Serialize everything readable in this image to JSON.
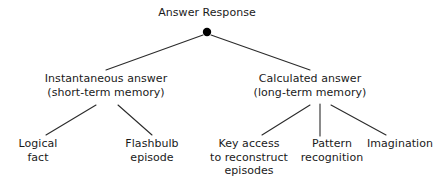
{
  "diagram": {
    "title": "Answer Response",
    "colors": {
      "background": "#ffffff",
      "text": "#1a1a1a",
      "edge": "#2b2b2b",
      "node_dot": "#000000"
    },
    "root": {
      "label": "Answer Response",
      "marker": "filled-circle-node"
    },
    "branches": [
      {
        "id": "instantaneous",
        "line1": "Instantaneous answer",
        "line2": "(short-term memory)",
        "children": [
          {
            "id": "logical-fact",
            "line1": "Logical",
            "line2": "fact",
            "line3": ""
          },
          {
            "id": "flashbulb-episode",
            "line1": "Flashbulb",
            "line2": "episode",
            "line3": ""
          }
        ]
      },
      {
        "id": "calculated",
        "line1": "Calculated answer",
        "line2": "(long-term memory)",
        "children": [
          {
            "id": "key-access",
            "line1": "Key access",
            "line2": "to reconstruct",
            "line3": "episodes"
          },
          {
            "id": "pattern-recognition",
            "line1": "Pattern",
            "line2": "recognition",
            "line3": ""
          },
          {
            "id": "imagination",
            "line1": "Imagination",
            "line2": "",
            "line3": ""
          }
        ]
      }
    ]
  }
}
